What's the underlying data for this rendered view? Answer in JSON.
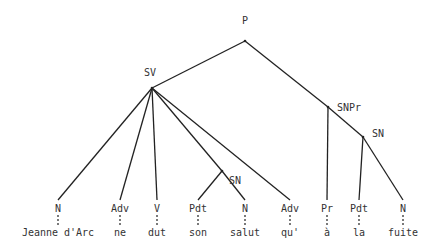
{
  "tree": {
    "nodes": [
      {
        "id": "P",
        "label": "P",
        "x": 245,
        "y": 41,
        "lx": 245,
        "ly": 16
      },
      {
        "id": "SV",
        "label": "SV",
        "x": 152,
        "y": 88,
        "lx": 150,
        "ly": 68
      },
      {
        "id": "SNPr",
        "label": "SNPr",
        "x": 328,
        "y": 107,
        "lx": 337,
        "ly": 103,
        "align": "left"
      },
      {
        "id": "SN1",
        "label": "SN",
        "x": 363,
        "y": 137,
        "lx": 372,
        "ly": 129,
        "align": "left"
      },
      {
        "id": "SN0",
        "label": "SN",
        "x": 222,
        "y": 171,
        "lx": 229,
        "ly": 176,
        "align": "left"
      },
      {
        "id": "N1",
        "label": "N",
        "x": 58,
        "y": 200,
        "lx": 58,
        "ly": 204
      },
      {
        "id": "Adv1",
        "label": "Adv",
        "x": 120,
        "y": 200,
        "lx": 120,
        "ly": 204
      },
      {
        "id": "V",
        "label": "V",
        "x": 157,
        "y": 200,
        "lx": 157,
        "ly": 204
      },
      {
        "id": "Pdt1",
        "label": "Pdt",
        "x": 198,
        "y": 200,
        "lx": 198,
        "ly": 204
      },
      {
        "id": "N2",
        "label": "N",
        "x": 245,
        "y": 200,
        "lx": 245,
        "ly": 204
      },
      {
        "id": "Adv2",
        "label": "Adv",
        "x": 290,
        "y": 200,
        "lx": 290,
        "ly": 204
      },
      {
        "id": "Pr",
        "label": "Pr",
        "x": 327,
        "y": 200,
        "lx": 327,
        "ly": 204
      },
      {
        "id": "Pdt2",
        "label": "Pdt",
        "x": 359,
        "y": 200,
        "lx": 359,
        "ly": 204
      },
      {
        "id": "N3",
        "label": "N",
        "x": 403,
        "y": 200,
        "lx": 403,
        "ly": 204
      }
    ],
    "edges": [
      [
        "P",
        "SV"
      ],
      [
        "P",
        "SNPr"
      ],
      [
        "SV",
        "N1"
      ],
      [
        "SV",
        "Adv1"
      ],
      [
        "SV",
        "V"
      ],
      [
        "SV",
        "SN0"
      ],
      [
        "SV",
        "Adv2"
      ],
      [
        "SN0",
        "Pdt1"
      ],
      [
        "SN0",
        "N2"
      ],
      [
        "SNPr",
        "Pr"
      ],
      [
        "SNPr",
        "SN1"
      ],
      [
        "SN1",
        "Pdt2"
      ],
      [
        "SN1",
        "N3"
      ]
    ],
    "words": [
      {
        "label": "Jeanne d'Arc",
        "x": 58,
        "under": "N1"
      },
      {
        "label": "ne",
        "x": 120,
        "under": "Adv1"
      },
      {
        "label": "dut",
        "x": 157,
        "under": "V"
      },
      {
        "label": "son",
        "x": 198,
        "under": "Pdt1"
      },
      {
        "label": "salut",
        "x": 245,
        "under": "N2"
      },
      {
        "label": "qu'",
        "x": 290,
        "under": "Adv2"
      },
      {
        "label": "à",
        "x": 327,
        "under": "Pr"
      },
      {
        "label": "la",
        "x": 359,
        "under": "Pdt2"
      },
      {
        "label": "fuite",
        "x": 403,
        "under": "N3"
      }
    ],
    "word_y": 228,
    "line_color": "#222222",
    "text_color": "#333333"
  }
}
